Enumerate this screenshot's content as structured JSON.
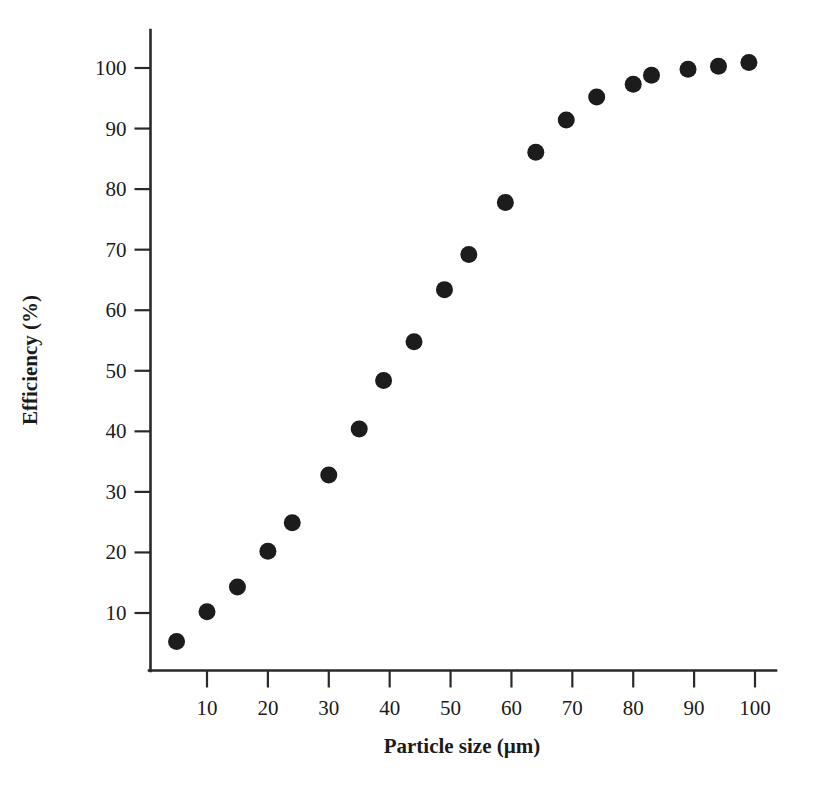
{
  "chart_data": {
    "type": "scatter",
    "title": "",
    "xlabel": "Particle size (µm)",
    "ylabel": "Efficiency (%)",
    "xlim": [
      0,
      103
    ],
    "ylim": [
      0,
      105
    ],
    "xticks": [
      10,
      20,
      30,
      40,
      50,
      60,
      70,
      80,
      90,
      100
    ],
    "xtick_labels": [
      "10",
      "20",
      "30",
      "40",
      "50",
      "60",
      "70",
      "80",
      "90",
      "100"
    ],
    "yticks": [
      10,
      20,
      30,
      40,
      50,
      60,
      70,
      80,
      90,
      100
    ],
    "ytick_labels": [
      "10",
      "20",
      "30",
      "40",
      "50",
      "60",
      "70",
      "80",
      "90",
      "100"
    ],
    "grid": false,
    "legend": false,
    "marker": {
      "shape": "circle",
      "color": "#1c1c1c",
      "size_px": 17
    },
    "series": [
      {
        "name": "Collection efficiency",
        "x": [
          5,
          10,
          15,
          20,
          24,
          30,
          35,
          39,
          44,
          49,
          53,
          59,
          64,
          69,
          74,
          80,
          83,
          89,
          94,
          99
        ],
        "y": [
          5.3,
          10.2,
          14.3,
          20.2,
          24.9,
          32.8,
          40.4,
          48.4,
          54.8,
          63.4,
          69.2,
          77.8,
          86.1,
          91.4,
          95.2,
          97.3,
          98.8,
          99.8,
          100.3,
          100.9
        ],
        "points": [
          {
            "x": 5,
            "y": 5.3
          },
          {
            "x": 10,
            "y": 10.2
          },
          {
            "x": 15,
            "y": 14.3
          },
          {
            "x": 20,
            "y": 20.2
          },
          {
            "x": 24,
            "y": 24.9
          },
          {
            "x": 30,
            "y": 32.8
          },
          {
            "x": 35,
            "y": 40.4
          },
          {
            "x": 39,
            "y": 48.4
          },
          {
            "x": 44,
            "y": 54.8
          },
          {
            "x": 49,
            "y": 63.4
          },
          {
            "x": 53,
            "y": 69.2
          },
          {
            "x": 59,
            "y": 77.8
          },
          {
            "x": 64,
            "y": 86.1
          },
          {
            "x": 69,
            "y": 91.4
          },
          {
            "x": 74,
            "y": 95.2
          },
          {
            "x": 80,
            "y": 97.3
          },
          {
            "x": 83,
            "y": 98.8
          },
          {
            "x": 89,
            "y": 99.8
          },
          {
            "x": 94,
            "y": 100.3
          },
          {
            "x": 99,
            "y": 100.9
          }
        ]
      }
    ]
  }
}
